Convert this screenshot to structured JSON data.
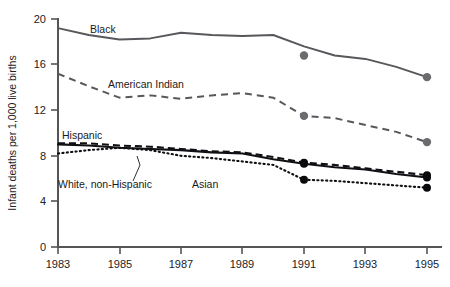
{
  "chart_data": {
    "type": "line",
    "title": "",
    "xlabel": "",
    "ylabel": "Infant deaths per 1,000 live births",
    "xlim": [
      1983,
      1995
    ],
    "ylim": [
      0,
      20
    ],
    "grid": false,
    "legend": "inline-labels",
    "x": [
      1983,
      1984,
      1985,
      1986,
      1987,
      1988,
      1989,
      1990,
      1991,
      1992,
      1993,
      1994,
      1995
    ],
    "xticks": [
      "1983",
      "1985",
      "1987",
      "1989",
      "1991",
      "1993",
      "1995"
    ],
    "yticks": [
      "0",
      "4",
      "8",
      "12",
      "16",
      "20"
    ],
    "series": [
      {
        "name": "Black",
        "style": "solid",
        "color": "#58585c",
        "label": "Black",
        "markers_at": [
          1991,
          1995
        ],
        "marker_color": "#6c6c70",
        "values": [
          19.2,
          18.6,
          18.2,
          18.3,
          18.8,
          18.6,
          18.5,
          18.6,
          17.6,
          16.8,
          16.5,
          15.8,
          14.9
        ],
        "labeled_points": [
          {
            "x": 1991,
            "y": 16.8
          },
          {
            "x": 1995,
            "y": 14.9
          }
        ]
      },
      {
        "name": "American Indian",
        "style": "dashed",
        "color": "#58585c",
        "label": "American Indian",
        "markers_at": [
          1991,
          1995
        ],
        "marker_color": "#6c6c70",
        "values": [
          15.2,
          14.1,
          13.1,
          13.3,
          13.0,
          13.3,
          13.5,
          13.1,
          11.5,
          11.3,
          10.7,
          10.1,
          9.2
        ],
        "labeled_points": [
          {
            "x": 1991,
            "y": 11.5
          },
          {
            "x": 1995,
            "y": 9.2
          }
        ]
      },
      {
        "name": "Hispanic",
        "style": "dashed",
        "color": "#101014",
        "label": "Hispanic",
        "markers_at": [
          1991,
          1995
        ],
        "marker_color": "#0a0a0c",
        "values": [
          9.1,
          9.1,
          8.9,
          8.8,
          8.6,
          8.4,
          8.3,
          7.9,
          7.4,
          7.2,
          6.9,
          6.6,
          6.3
        ],
        "labeled_points": [
          {
            "x": 1991,
            "y": 7.4
          },
          {
            "x": 1995,
            "y": 6.3
          }
        ]
      },
      {
        "name": "White, non-Hispanic",
        "style": "solid",
        "color": "#101014",
        "label": "White, non-Hispanic",
        "markers_at": [
          1991,
          1995
        ],
        "marker_color": "#0a0a0c",
        "values": [
          9.0,
          8.9,
          8.7,
          8.6,
          8.5,
          8.3,
          8.2,
          7.7,
          7.3,
          7.0,
          6.8,
          6.4,
          6.1
        ],
        "labeled_points": [
          {
            "x": 1991,
            "y": 7.3
          },
          {
            "x": 1995,
            "y": 6.1
          }
        ]
      },
      {
        "name": "Asian",
        "style": "dotted",
        "color": "#101014",
        "label": "Asian",
        "markers_at": [
          1991,
          1995
        ],
        "marker_color": "#0a0a0c",
        "values": [
          8.2,
          8.5,
          8.7,
          8.5,
          8.0,
          7.8,
          7.5,
          7.2,
          5.9,
          5.8,
          5.6,
          5.4,
          5.2
        ],
        "labeled_points": [
          {
            "x": 1991,
            "y": 5.9
          },
          {
            "x": 1995,
            "y": 5.2
          }
        ]
      }
    ],
    "annotations": [
      {
        "text": "Black",
        "series": "Black"
      },
      {
        "text": "American Indian",
        "series": "American Indian"
      },
      {
        "text": "Hispanic",
        "series": "Hispanic"
      },
      {
        "text": "White, non-Hispanic",
        "series": "White, non-Hispanic"
      },
      {
        "text": "Asian",
        "series": "Asian"
      }
    ]
  },
  "axes": {
    "y_title": "Infant deaths per 1,000 live births",
    "y_ticks": [
      "20",
      "16",
      "12",
      "8",
      "4",
      "0"
    ],
    "x_ticks": [
      "1983",
      "1985",
      "1987",
      "1989",
      "1991",
      "1993",
      "1995"
    ]
  },
  "labels": {
    "black": "Black",
    "american_indian": "American Indian",
    "hispanic": "Hispanic",
    "white_non_hispanic": "White, non-Hispanic",
    "asian": "Asian"
  }
}
